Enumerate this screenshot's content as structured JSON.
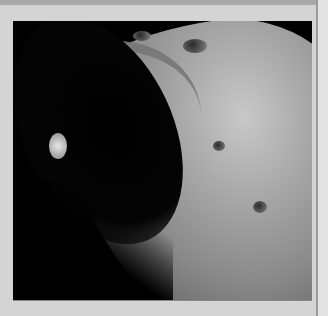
{
  "image": {
    "subject": "Irregular cratered moon (Phobos) against black space",
    "colors": {
      "frame": "#d4d4d4",
      "topbar": "#a9a9a9",
      "space": "#000000",
      "surface": "#9a9a9a"
    }
  }
}
